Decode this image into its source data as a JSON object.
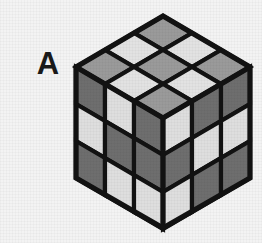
{
  "figure": {
    "label": "A",
    "caption": "",
    "object": "isometric-3x3x3-cube"
  },
  "canvas": {
    "width": 262,
    "height": 243,
    "background_color": "#f3f3f3"
  },
  "palette": {
    "outline": "#121212",
    "top_medium": "#9a9a9a",
    "top_light": "#e2e2e2",
    "side_dark": "#6e6e6e",
    "side_light": "#dedede",
    "label_color": "#1a1a1a"
  },
  "geometry": {
    "center_x": 163,
    "apex_y": 16,
    "shoulder_y": 67,
    "hip_y": 178,
    "bottom_y": 228,
    "left_x": 76,
    "right_x": 250
  },
  "chart_data": {
    "type": "table",
    "faces": [
      {
        "name": "top",
        "rows": 3,
        "cols": 3,
        "cells": [
          [
            "top_medium",
            "top_light",
            "top_medium"
          ],
          [
            "top_light",
            "top_medium",
            "top_light"
          ],
          [
            "top_medium",
            "top_light",
            "top_medium"
          ]
        ]
      },
      {
        "name": "left",
        "rows": 3,
        "cols": 3,
        "cells": [
          [
            "side_dark",
            "side_light",
            "side_dark"
          ],
          [
            "side_light",
            "side_dark",
            "side_dark"
          ],
          [
            "side_dark",
            "side_light",
            "side_light"
          ]
        ]
      },
      {
        "name": "right",
        "rows": 3,
        "cols": 3,
        "cells": [
          [
            "side_light",
            "side_dark",
            "side_dark"
          ],
          [
            "side_dark",
            "side_light",
            "side_light"
          ],
          [
            "side_light",
            "side_dark",
            "side_dark"
          ]
        ]
      }
    ]
  }
}
